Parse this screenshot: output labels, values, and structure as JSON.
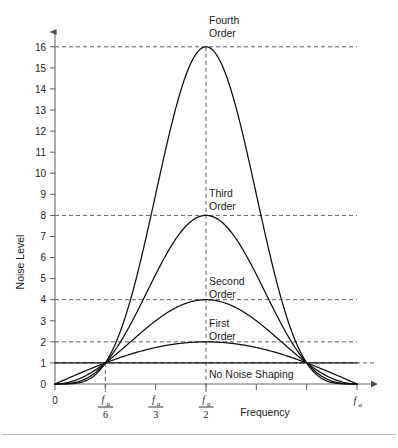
{
  "figure": {
    "background_color": "#ffffff",
    "curve_color": "#0d0d0d",
    "grid_color": "#4a4a4a",
    "axis_color": "#6b6b6b",
    "rule_color": "#b9b9b9"
  },
  "axes": {
    "y_axis_title": "Noise Level",
    "x_axis_title": "Frequency",
    "y_ticks": [
      "0",
      "1",
      "2",
      "3",
      "4",
      "5",
      "6",
      "7",
      "8",
      "9",
      "10",
      "11",
      "12",
      "13",
      "14",
      "15",
      "16"
    ],
    "y_values": [
      0,
      1,
      2,
      3,
      4,
      5,
      6,
      7,
      8,
      9,
      10,
      11,
      12,
      13,
      14,
      15,
      16
    ],
    "x_tick_labels": [
      {
        "id": "origin",
        "text": "0",
        "kind": "plain",
        "value": 0
      },
      {
        "id": "fa-over-6",
        "numerator": "f",
        "sub": "a",
        "denominator": "6",
        "kind": "fraction",
        "value": 0.1667
      },
      {
        "id": "fa-over-3",
        "numerator": "f",
        "sub": "a",
        "denominator": "3",
        "kind": "fraction",
        "value": 0.3333
      },
      {
        "id": "fa-over-2",
        "numerator": "f",
        "sub": "a",
        "denominator": "2",
        "kind": "fraction",
        "value": 0.5
      },
      {
        "id": "fa",
        "numerator": "f",
        "sub": "a",
        "kind": "symbol",
        "value": 1.0
      }
    ],
    "x_untitled_ticks": [
      0.6667,
      0.8333
    ]
  },
  "curve_labels": [
    {
      "id": "fourth-order",
      "line1": "Fourth",
      "line2": "Order"
    },
    {
      "id": "third-order",
      "line1": "Third",
      "line2": "Order"
    },
    {
      "id": "second-order",
      "line1": "Second",
      "line2": "Order"
    },
    {
      "id": "first-order",
      "line1": "First",
      "line2": "Order"
    },
    {
      "id": "no-noise-shaping",
      "line1": "No Noise Shaping",
      "line2": ""
    }
  ],
  "chart_data": {
    "type": "line",
    "title": "",
    "xlabel": "Frequency",
    "ylabel": "Noise Level",
    "xlim": [
      0,
      1.0
    ],
    "ylim": [
      0,
      16
    ],
    "grid": false,
    "legend": "inline-annotations",
    "x_unit": "f/f_a",
    "x_tick_values": [
      0,
      0.1667,
      0.3333,
      0.5,
      0.6667,
      0.8333,
      1.0
    ],
    "x_tick_text": [
      "0",
      "fa/6",
      "fa/3",
      "fa/2",
      "",
      "",
      "fa"
    ],
    "y_tick_values": [
      0,
      1,
      2,
      3,
      4,
      5,
      6,
      7,
      8,
      9,
      10,
      11,
      12,
      13,
      14,
      15,
      16
    ],
    "formula": "NoiseLevel(f) = (2*sin(pi*f/fa))^N",
    "dashed_reference_lines": {
      "horizontal_y": [
        1,
        2,
        4,
        8,
        16
      ],
      "vertical_x": [
        0.1667,
        0.5
      ]
    },
    "crossing_points": [
      {
        "x": 0.1667,
        "y": 1,
        "note": "all orders pass through fa/6 at level 1"
      },
      {
        "x": 0.8333,
        "y": 1,
        "note": "all orders pass through 5fa/6 at level 1"
      }
    ],
    "series": [
      {
        "name": "No Noise Shaping",
        "order": 0,
        "peak_value": 1,
        "peak_x": 0.5,
        "x": [
          0,
          0.0417,
          0.0833,
          0.125,
          0.1667,
          0.25,
          0.3333,
          0.4167,
          0.5,
          0.5833,
          0.6667,
          0.75,
          0.8333,
          0.875,
          0.9167,
          0.9583,
          1.0
        ],
        "values": [
          1,
          1,
          1,
          1,
          1,
          1,
          1,
          1,
          1,
          1,
          1,
          1,
          1,
          1,
          1,
          1,
          1
        ]
      },
      {
        "name": "First Order",
        "order": 1,
        "peak_value": 2,
        "peak_x": 0.5,
        "x": [
          0,
          0.0417,
          0.0833,
          0.125,
          0.1667,
          0.25,
          0.3333,
          0.4167,
          0.5,
          0.5833,
          0.6667,
          0.75,
          0.8333,
          0.875,
          0.9167,
          0.9583,
          1.0
        ],
        "values": [
          0,
          0.261,
          0.518,
          0.765,
          1.0,
          1.414,
          1.732,
          1.932,
          2.0,
          1.932,
          1.732,
          1.414,
          1.0,
          0.765,
          0.518,
          0.261,
          0
        ]
      },
      {
        "name": "Second Order",
        "order": 2,
        "peak_value": 4,
        "peak_x": 0.5,
        "x": [
          0,
          0.0417,
          0.0833,
          0.125,
          0.1667,
          0.25,
          0.3333,
          0.4167,
          0.5,
          0.5833,
          0.6667,
          0.75,
          0.8333,
          0.875,
          0.9167,
          0.9583,
          1.0
        ],
        "values": [
          0,
          0.068,
          0.268,
          0.586,
          1.0,
          2.0,
          3.0,
          3.732,
          4.0,
          3.732,
          3.0,
          2.0,
          1.0,
          0.586,
          0.268,
          0.068,
          0
        ]
      },
      {
        "name": "Third Order",
        "order": 3,
        "peak_value": 8,
        "peak_x": 0.5,
        "x": [
          0,
          0.0417,
          0.0833,
          0.125,
          0.1667,
          0.25,
          0.3333,
          0.4167,
          0.5,
          0.5833,
          0.6667,
          0.75,
          0.8333,
          0.875,
          0.9167,
          0.9583,
          1.0
        ],
        "values": [
          0,
          0.018,
          0.139,
          0.448,
          1.0,
          2.828,
          5.196,
          7.21,
          8.0,
          7.21,
          5.196,
          2.828,
          1.0,
          0.448,
          0.139,
          0.018,
          0
        ]
      },
      {
        "name": "Fourth Order",
        "order": 4,
        "peak_value": 16,
        "peak_x": 0.5,
        "x": [
          0,
          0.0417,
          0.0833,
          0.125,
          0.1667,
          0.25,
          0.3333,
          0.4167,
          0.5,
          0.5833,
          0.6667,
          0.75,
          0.8333,
          0.875,
          0.9167,
          0.9583,
          1.0
        ],
        "values": [
          0,
          0.005,
          0.072,
          0.343,
          1.0,
          4.0,
          9.0,
          13.93,
          16.0,
          13.93,
          9.0,
          4.0,
          1.0,
          0.343,
          0.072,
          0.005,
          0
        ]
      }
    ]
  }
}
